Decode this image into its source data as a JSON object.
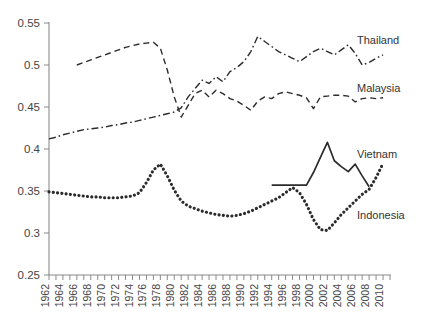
{
  "chart_data": {
    "type": "line",
    "title": "",
    "xlabel": "",
    "ylabel": "",
    "xlim": [
      1962,
      2011
    ],
    "ylim": [
      0.25,
      0.55
    ],
    "yticks": [
      "0.25",
      "0.3",
      "0.35",
      "0.4",
      "0.45",
      "0.5",
      "0.55"
    ],
    "ytick_values": [
      0.25,
      0.3,
      0.35,
      0.4,
      0.45,
      0.5,
      0.55
    ],
    "xticks": [
      "1962",
      "1964",
      "1966",
      "1968",
      "1970",
      "1972",
      "1974",
      "1976",
      "1978",
      "1980",
      "1982",
      "1984",
      "1986",
      "1988",
      "1990",
      "1992",
      "1994",
      "1996",
      "1998",
      "2000",
      "2002",
      "2004",
      "2006",
      "2008",
      "2010"
    ],
    "xtick_values": [
      1962,
      1964,
      1966,
      1968,
      1970,
      1972,
      1974,
      1976,
      1978,
      1980,
      1982,
      1984,
      1986,
      1988,
      1990,
      1992,
      1994,
      1996,
      1998,
      2000,
      2002,
      2004,
      2006,
      2008,
      2010
    ],
    "grid": false,
    "legend_position": "inline-right-of-series",
    "series": [
      {
        "name": "Thailand",
        "style": "dash-dot",
        "color": "#2b2b2b",
        "label_position": {
          "x": 357,
          "y": 44
        },
        "x": [
          1962,
          1963,
          1964,
          1965,
          1966,
          1967,
          1968,
          1969,
          1970,
          1971,
          1972,
          1973,
          1974,
          1975,
          1976,
          1977,
          1978,
          1979,
          1980,
          1981,
          1982,
          1983,
          1984,
          1985,
          1986,
          1987,
          1988,
          1989,
          1990,
          1991,
          1992,
          1993,
          1994,
          1995,
          1996,
          1997,
          1998,
          1999,
          2000,
          2001,
          2002,
          2003,
          2004,
          2005,
          2006,
          2007,
          2008,
          2009,
          2010
        ],
        "y": [
          0.412,
          0.414,
          0.417,
          0.419,
          0.421,
          0.423,
          0.424,
          0.425,
          0.426,
          0.428,
          0.429,
          0.431,
          0.432,
          0.434,
          0.436,
          0.438,
          0.44,
          0.442,
          0.444,
          0.449,
          0.462,
          0.472,
          0.482,
          0.478,
          0.486,
          0.48,
          0.492,
          0.497,
          0.504,
          0.516,
          0.534,
          0.528,
          0.522,
          0.516,
          0.512,
          0.508,
          0.504,
          0.51,
          0.516,
          0.52,
          0.516,
          0.512,
          0.518,
          0.524,
          0.514,
          0.5,
          0.503,
          0.508,
          0.512
        ]
      },
      {
        "name": "Malaysia",
        "style": "dashed",
        "color": "#6e6e6e",
        "label_position": {
          "x": 357,
          "y": 92
        },
        "x": [
          1966,
          1967,
          1968,
          1969,
          1970,
          1971,
          1972,
          1973,
          1974,
          1975,
          1976,
          1977,
          1978,
          1979,
          1980,
          1981,
          1982,
          1983,
          1984,
          1985,
          1986,
          1987,
          1988,
          1989,
          1990,
          1991,
          1992,
          1993,
          1994,
          1995,
          1996,
          1997,
          1998,
          1999,
          2000,
          2001,
          2002,
          2003,
          2004,
          2005,
          2006,
          2007,
          2008,
          2009,
          2010
        ],
        "y": [
          0.5,
          0.503,
          0.506,
          0.509,
          0.512,
          0.515,
          0.518,
          0.521,
          0.523,
          0.525,
          0.526,
          0.527,
          0.52,
          0.494,
          0.462,
          0.438,
          0.452,
          0.466,
          0.47,
          0.462,
          0.47,
          0.466,
          0.46,
          0.457,
          0.452,
          0.446,
          0.457,
          0.462,
          0.46,
          0.466,
          0.468,
          0.466,
          0.464,
          0.461,
          0.448,
          0.462,
          0.463,
          0.464,
          0.464,
          0.463,
          0.456,
          0.46,
          0.461,
          0.46,
          0.461
        ]
      },
      {
        "name": "Vietnam",
        "style": "solid",
        "color": "#1a1a1a",
        "label_position": {
          "x": 357,
          "y": 158
        },
        "x": [
          1994,
          1995,
          1996,
          1997,
          1998,
          1999,
          2000,
          2001,
          2002,
          2003,
          2004,
          2005,
          2006,
          2007,
          2008
        ],
        "y": [
          0.357,
          0.357,
          0.357,
          0.357,
          0.357,
          0.357,
          0.372,
          0.39,
          0.408,
          0.386,
          0.379,
          0.373,
          0.382,
          0.368,
          0.355
        ]
      },
      {
        "name": "Indonesia",
        "style": "dotted",
        "color": "#1a1a1a",
        "label_position": {
          "x": 357,
          "y": 219
        },
        "x": [
          1962,
          1963,
          1964,
          1965,
          1966,
          1967,
          1968,
          1969,
          1970,
          1971,
          1972,
          1973,
          1974,
          1975,
          1976,
          1977,
          1978,
          1979,
          1980,
          1981,
          1982,
          1983,
          1984,
          1985,
          1986,
          1987,
          1988,
          1989,
          1990,
          1991,
          1992,
          1993,
          1994,
          1995,
          1996,
          1997,
          1998,
          1999,
          2000,
          2001,
          2002,
          2003,
          2004,
          2005,
          2006,
          2007,
          2008,
          2009,
          2010
        ],
        "y": [
          0.349,
          0.348,
          0.347,
          0.346,
          0.345,
          0.344,
          0.343,
          0.343,
          0.342,
          0.342,
          0.342,
          0.343,
          0.344,
          0.348,
          0.36,
          0.375,
          0.382,
          0.368,
          0.351,
          0.338,
          0.332,
          0.329,
          0.326,
          0.324,
          0.322,
          0.321,
          0.32,
          0.321,
          0.323,
          0.326,
          0.33,
          0.334,
          0.338,
          0.342,
          0.348,
          0.354,
          0.348,
          0.334,
          0.316,
          0.304,
          0.303,
          0.312,
          0.322,
          0.33,
          0.338,
          0.346,
          0.352,
          0.366,
          0.383
        ]
      }
    ]
  },
  "axis": {
    "y_label_top": "0.55",
    "y_label_bottom": "0.25"
  }
}
